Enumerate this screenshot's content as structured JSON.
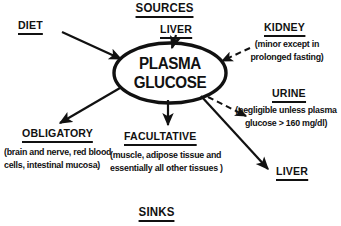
{
  "diagram": {
    "title_top": "SOURCES",
    "title_bottom": "SINKS",
    "center_node": {
      "line1": "PLASMA",
      "line2": "GLUCOSE"
    },
    "sources": [
      {
        "id": "diet",
        "label": "DIET",
        "detail": "",
        "arrow": "solid-in"
      },
      {
        "id": "liver-top",
        "label": "LIVER",
        "detail": "",
        "arrow": "solid-in"
      },
      {
        "id": "kidney",
        "label": "KIDNEY",
        "detail": "(minor except in prolonged fasting)",
        "arrow": "dashed-in"
      }
    ],
    "sinks": [
      {
        "id": "obligatory",
        "label": "OBLIGATORY",
        "detail": "(brain and nerve, red blood cells, intestinal mucosa)",
        "arrow": "solid-out"
      },
      {
        "id": "facultative",
        "label": "FACULTATIVE",
        "detail": "(muscle, adipose tissue and essentially all other tissues )",
        "arrow": "solid-out"
      },
      {
        "id": "urine",
        "label": "URINE",
        "detail": "(negligible unless plasma glucose > 160 mg/dl)",
        "arrow": "dashed-out"
      },
      {
        "id": "liver-bottom-right",
        "label": "LIVER",
        "detail": "",
        "arrow": "solid-out"
      }
    ],
    "colors": {
      "ink": "#111111",
      "background": "#ffffff"
    }
  }
}
